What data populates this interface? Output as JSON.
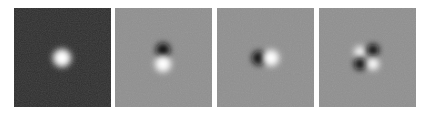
{
  "figure": {
    "panels": [
      {
        "id": "p1",
        "left": 14,
        "background": "#2e2e2e",
        "blobs": [
          {
            "cx": 48,
            "cy": 50,
            "r": 9,
            "color": "#ffffff"
          }
        ]
      },
      {
        "id": "p2",
        "left": 115,
        "background": "#8f8f8f",
        "blobs": [
          {
            "cx": 48,
            "cy": 42,
            "r": 7,
            "color": "#111111"
          },
          {
            "cx": 48,
            "cy": 56,
            "r": 8,
            "color": "#ffffff"
          }
        ]
      },
      {
        "id": "p3",
        "left": 217,
        "background": "#8f8f8f",
        "blobs": [
          {
            "cx": 42,
            "cy": 50,
            "r": 7,
            "color": "#111111"
          },
          {
            "cx": 54,
            "cy": 50,
            "r": 8,
            "color": "#ffffff"
          }
        ]
      },
      {
        "id": "p4",
        "left": 319,
        "background": "#8f8f8f",
        "blobs": [
          {
            "cx": 41,
            "cy": 44,
            "r": 6,
            "color": "#f2f2f2"
          },
          {
            "cx": 54,
            "cy": 42,
            "r": 6,
            "color": "#111111"
          },
          {
            "cx": 41,
            "cy": 56,
            "r": 6,
            "color": "#111111"
          },
          {
            "cx": 54,
            "cy": 56,
            "r": 6,
            "color": "#ffffff"
          }
        ]
      }
    ]
  }
}
